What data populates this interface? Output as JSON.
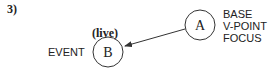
{
  "diagram": {
    "number_label": "3)",
    "node_b": {
      "letter": "B",
      "annotation": "(live)",
      "side_label": "EVENT"
    },
    "node_a": {
      "letter": "A",
      "roles": [
        "BASE",
        "V-POINT",
        "FOCUS"
      ]
    },
    "edge": {
      "from": "A",
      "to": "B",
      "type": "arrow"
    },
    "colors": {
      "stroke": "#333333",
      "text": "#222222"
    }
  }
}
